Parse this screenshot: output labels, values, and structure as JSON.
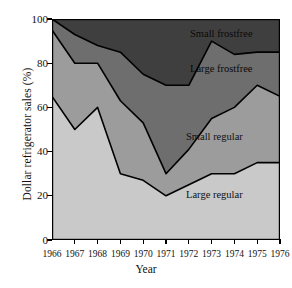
{
  "chart_data": {
    "type": "area",
    "stacked": true,
    "title": "",
    "xlabel": "Year",
    "ylabel": "Dollar refrigerator sales (%)",
    "x": [
      1966,
      1967,
      1968,
      1969,
      1970,
      1971,
      1972,
      1973,
      1974,
      1975,
      1976
    ],
    "xtick_labels": [
      "1966",
      "1967",
      "1968",
      "1969",
      "1970",
      "1971",
      "1972",
      "1973",
      "1974",
      "1975",
      "1976"
    ],
    "ytick_labels": [
      "0",
      "20",
      "40",
      "60",
      "80",
      "100"
    ],
    "yticks": [
      0,
      20,
      40,
      60,
      80,
      100
    ],
    "ylim": [
      0,
      100
    ],
    "xlim": [
      1966,
      1976
    ],
    "grid": false,
    "legend_position": "inline-annotations",
    "series": [
      {
        "name": "Large regular",
        "color": "#c9c9c9",
        "values": [
          65,
          50,
          60,
          30,
          27,
          20,
          25,
          30,
          30,
          35,
          35
        ],
        "cumulative_top": [
          65,
          50,
          60,
          30,
          27,
          20,
          25,
          30,
          30,
          35,
          35
        ]
      },
      {
        "name": "Small regular",
        "color": "#9c9c9c",
        "values": [
          30,
          30,
          20,
          33,
          26,
          10,
          16,
          25,
          30,
          35,
          30
        ],
        "cumulative_top": [
          95,
          80,
          80,
          63,
          53,
          30,
          41,
          55,
          60,
          70,
          65
        ]
      },
      {
        "name": "Large frostfree",
        "color": "#6e6e6e",
        "values": [
          5,
          13,
          8,
          22,
          22,
          40,
          29,
          35,
          24,
          15,
          20
        ],
        "cumulative_top": [
          100,
          93,
          88,
          85,
          75,
          70,
          70,
          90,
          84,
          85,
          85
        ]
      },
      {
        "name": "Small frostfree",
        "color": "#3f3f3f",
        "values": [
          0,
          7,
          12,
          15,
          25,
          30,
          30,
          10,
          16,
          15,
          15
        ],
        "cumulative_top": [
          100,
          100,
          100,
          100,
          100,
          100,
          100,
          100,
          100,
          100,
          100
        ]
      }
    ],
    "annotations": [
      {
        "text": "Small frostfree",
        "series": "Small frostfree"
      },
      {
        "text": "Large frostfree",
        "series": "Large frostfree"
      },
      {
        "text": "Small regular",
        "series": "Small regular"
      },
      {
        "text": "Large regular",
        "series": "Large regular"
      }
    ]
  },
  "axis": {
    "y_title": "Dollar refrigerator sales (%)",
    "x_title": "Year"
  },
  "colors": {
    "large_regular": "#c9c9c9",
    "small_regular": "#9c9c9c",
    "large_frostfree": "#6e6e6e",
    "small_frostfree": "#3f3f3f",
    "axis": "#000000",
    "background": "#ffffff"
  }
}
